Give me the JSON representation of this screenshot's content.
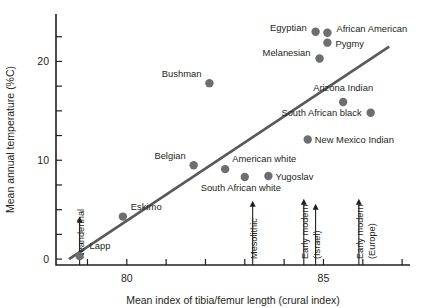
{
  "chart_data": {
    "type": "scatter",
    "title": "",
    "xlabel": "Mean index of tibia/femur length (crural index)",
    "ylabel": "Mean annual temperature (%C)",
    "xlim": [
      78.2,
      87.2
    ],
    "ylim": [
      -0.6,
      24.8
    ],
    "xticks": [
      79,
      80,
      81,
      82,
      83,
      84,
      85,
      86,
      87
    ],
    "xticklabels": [
      "",
      "80",
      "",
      "",
      "",
      "",
      "85",
      "",
      ""
    ],
    "yticks": [
      0,
      2.5,
      5,
      7.5,
      10,
      12.5,
      15,
      17.5,
      20,
      22.5
    ],
    "yticklabels": [
      "0",
      "",
      "",
      "",
      "10",
      "",
      "",
      "",
      "20",
      ""
    ],
    "grid": false,
    "legend": false,
    "points": [
      {
        "label": "Lapp",
        "x": 78.8,
        "y": 0.3,
        "label_dx": 10,
        "label_dy": -7,
        "anchor": "start"
      },
      {
        "label": "Eskimo",
        "x": 79.9,
        "y": 4.3,
        "label_dx": 8,
        "label_dy": -7,
        "anchor": "start"
      },
      {
        "label": "Belgian",
        "x": 81.7,
        "y": 9.5,
        "label_dx": -8,
        "label_dy": -6,
        "anchor": "end"
      },
      {
        "label": "American white",
        "x": 82.5,
        "y": 9.1,
        "label_dx": 7,
        "label_dy": -7,
        "anchor": "start"
      },
      {
        "label": "South African white",
        "x": 83.0,
        "y": 8.3,
        "label_dx": -4,
        "label_dy": 14,
        "anchor": "middle"
      },
      {
        "label": "Yugoslav",
        "x": 83.6,
        "y": 8.4,
        "label_dx": 7,
        "label_dy": 4,
        "anchor": "start"
      },
      {
        "label": "Bushman",
        "x": 82.1,
        "y": 17.8,
        "label_dx": -8,
        "label_dy": -6,
        "anchor": "end"
      },
      {
        "label": "New Mexico Indian",
        "x": 84.6,
        "y": 12.1,
        "label_dx": 7,
        "label_dy": 3,
        "anchor": "start"
      },
      {
        "label": "Arizona Indian",
        "x": 85.5,
        "y": 15.9,
        "label_dx": 0,
        "label_dy": -11,
        "anchor": "middle"
      },
      {
        "label": "South African black",
        "x": 86.2,
        "y": 14.8,
        "label_dx": -9,
        "label_dy": 3,
        "anchor": "end"
      },
      {
        "label": "Melanesian",
        "x": 84.9,
        "y": 20.3,
        "label_dx": -9,
        "label_dy": -2,
        "anchor": "end"
      },
      {
        "label": "Pygmy",
        "x": 85.1,
        "y": 21.9,
        "label_dx": 8,
        "label_dy": 4,
        "anchor": "start"
      },
      {
        "label": "Egyptian",
        "x": 84.8,
        "y": 23.0,
        "label_dx": -9,
        "label_dy": -1,
        "anchor": "end"
      },
      {
        "label": "African American",
        "x": 85.1,
        "y": 22.9,
        "label_dx": 9,
        "label_dy": -1,
        "anchor": "start"
      }
    ],
    "fit_line": {
      "x0": 78.53,
      "y0": 0.0,
      "x1": 86.67,
      "y1": 21.5
    },
    "reference_marks": [
      {
        "label": "Neanderthal",
        "x": 78.8,
        "y_top": 4.3,
        "label_rotated": true
      },
      {
        "label": "Mesolithic",
        "x": 83.2,
        "y_top": 5.9,
        "label_rotated": true
      },
      {
        "label": "Early modern",
        "x": 84.5,
        "y_top": 6.1,
        "label_rotated": true
      },
      {
        "label": "(Israel)",
        "x": 84.8,
        "y_top": 5.6,
        "label_rotated": true,
        "no_arrow": false
      },
      {
        "label": "Early modern",
        "x": 85.9,
        "y_top": 6.1,
        "label_rotated": true
      },
      {
        "label": "(Europe)",
        "x": 86.2,
        "y_top": 5.6,
        "label_rotated": true,
        "no_arrow": true
      }
    ],
    "colors": {
      "point": "#6d6e71",
      "line": "#58595b",
      "axis": "#231f20",
      "text": "#231f20",
      "background": "#ffffff"
    }
  }
}
